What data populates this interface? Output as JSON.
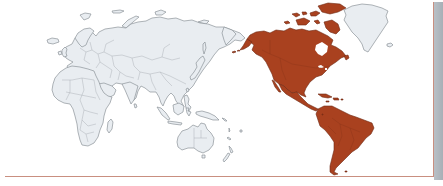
{
  "map": {
    "projection": "pacific-centered world map",
    "highlighted_region": {
      "name": "Americas",
      "includes": [
        "North America",
        "Central America",
        "Caribbean",
        "South America"
      ],
      "color": "#a9411f"
    },
    "other_land": {
      "includes": [
        "Europe",
        "Africa",
        "Asia",
        "Oceania",
        "Greenland"
      ],
      "fill_color": "#e9edf1",
      "outline_color": "#8d939a"
    },
    "background_color": "#ffffff",
    "frame_color": "#c98f80",
    "shadow_color": "#aeb5bb"
  }
}
